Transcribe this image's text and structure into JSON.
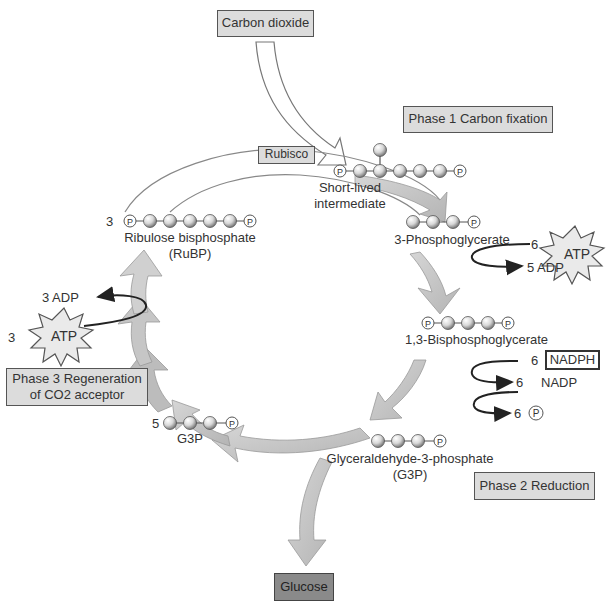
{
  "boxes": {
    "carbon_dioxide": "Carbon dioxide",
    "rubisco": "Rubisco",
    "phase1": "Phase 1 Carbon fixation",
    "phase2": "Phase 2 Reduction",
    "phase3_line1": "Phase 3 Regeneration",
    "phase3_line2": "of CO2 acceptor",
    "glucose": "Glucose",
    "nadph": "NADPH"
  },
  "molecules": {
    "intermediate_line1": "Short-lived",
    "intermediate_line2": "intermediate",
    "pga": "3-Phosphoglycerate",
    "bpg": "1,3-Bisphosphoglycerate",
    "g3p_line1": "Glyceraldehyde-3-phosphate",
    "g3p_line2": "(G3P)",
    "rubp_line1": "Ribulose bisphosphate",
    "rubp_line2": "(RuBP)",
    "g3p_short": "G3P"
  },
  "counts": {
    "rubp": "3",
    "g3p_recycled": "5",
    "atp_phase1": "6",
    "adp_phase1": "5 ADP",
    "nadph": "6",
    "nadp": "6",
    "nadp_label": "NADP",
    "pi": "6",
    "atp_phase3": "3",
    "adp_phase3": "3 ADP"
  },
  "symbols": {
    "atp": "ATP",
    "phosphate": "P"
  },
  "colors": {
    "arrow_fill": "#c4c4c4",
    "arrow_stroke": "#8c8c8c",
    "box_fill": "#dcdcdc",
    "glucose_fill": "#8a8a8a"
  }
}
